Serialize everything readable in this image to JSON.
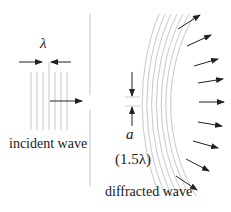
{
  "diagram": {
    "labels": {
      "wavelength": "λ",
      "incident": "incident wave",
      "slit_width_symbol": "a",
      "slit_width_value": "(1.5λ)",
      "diffracted": "diffracted wave"
    },
    "colors": {
      "wavefront": "#c8c8c8",
      "arrow": "#222222",
      "barrier": "#cfcfcf",
      "text": "#1a1a1a"
    },
    "incident_wavefronts": 7,
    "diffracted_wavefronts": 7,
    "diffracted_arrows": 10
  }
}
